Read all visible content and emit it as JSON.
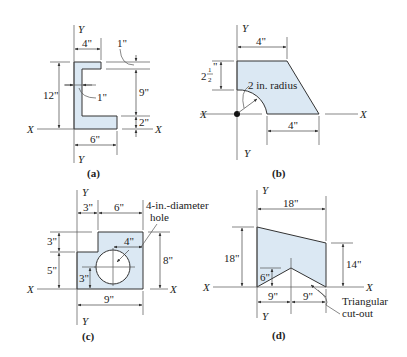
{
  "colors": {
    "fill": "#dbe8f3",
    "stroke": "#333333",
    "text": "#222222"
  },
  "axes": {
    "x": "X",
    "y": "Y"
  },
  "panels": {
    "a": {
      "caption": "(a)",
      "dims": {
        "top_width": "4\"",
        "height": "12\"",
        "web": "1\"",
        "flange_top": "1\"",
        "inner": "9\"",
        "bottom_flange": "2\"",
        "bottom_width": "6\""
      }
    },
    "b": {
      "caption": "(b)",
      "dims": {
        "top_width": "4\"",
        "left_height_whole": "2",
        "left_height_frac_num": "1",
        "left_height_frac_den": "2",
        "left_height_unit": "\"",
        "radius": "2 in. radius",
        "bottom_width": "4\""
      }
    },
    "c": {
      "caption": "(c)",
      "dims": {
        "left_top": "3\"",
        "right_top": "6\"",
        "hole_label_1": "4-in.-diameter",
        "hole_label_2": "hole",
        "hole_offset": "4\"",
        "step": "3\"",
        "lower": "5\"",
        "hole_height": "3\"",
        "height": "8\"",
        "width": "9\""
      }
    },
    "d": {
      "caption": "(d)",
      "dims": {
        "top_width": "18\"",
        "left_height": "18\"",
        "right_height": "14\"",
        "cutout_height": "6\"",
        "half_left": "9\"",
        "half_right": "9\"",
        "cutout_label_1": "Triangular",
        "cutout_label_2": "cut-out"
      }
    }
  }
}
